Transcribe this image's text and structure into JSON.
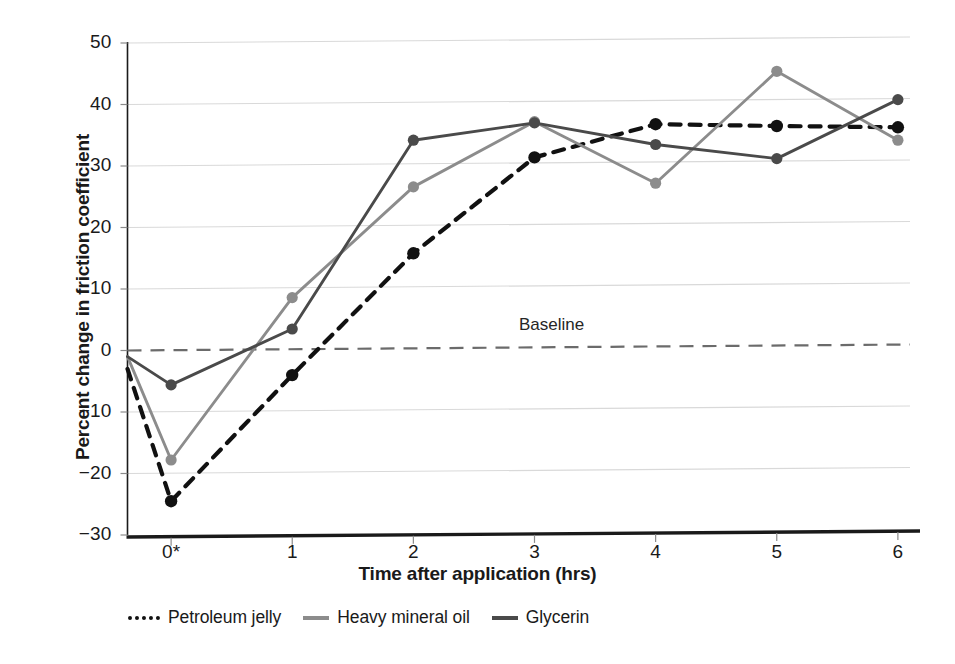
{
  "chart_data": {
    "type": "line",
    "title": "",
    "subtitle": "",
    "xlabel": "Time after application (hrs)",
    "ylabel": "Percent change in friction coefficient",
    "x": [
      0,
      1,
      2,
      3,
      4,
      5,
      6
    ],
    "xticklabels": [
      "0*",
      "1",
      "2",
      "3",
      "4",
      "5",
      "6"
    ],
    "xlim": [
      -0.36,
      6.1
    ],
    "ylim": [
      -30,
      50
    ],
    "yticks": [
      50,
      40,
      30,
      20,
      10,
      0,
      -10,
      -20,
      -30
    ],
    "yticklabels": [
      "50",
      "40",
      "30",
      "20",
      "10",
      "0",
      "−10",
      "−20",
      "−30"
    ],
    "grid": "horizontal",
    "legend_position": "below-axes-left",
    "annotations": [
      {
        "text": "Baseline",
        "x": 2.6,
        "y": 5.0
      }
    ],
    "reference_lines": [
      {
        "name": "baseline",
        "y": 0,
        "style": "dashed",
        "color": "#6b6b6b",
        "label": "Baseline"
      }
    ],
    "series": [
      {
        "name": "Petroleum jelly",
        "color": "#111111",
        "style": "dashed",
        "marker": "circle",
        "lead_in_y": -3.0,
        "values": [
          -24.5,
          -4.0,
          15.8,
          31.4,
          36.8,
          36.5,
          36.3
        ]
      },
      {
        "name": "Heavy mineral oil",
        "color": "#8c8c8c",
        "style": "solid",
        "marker": "circle",
        "lead_in_y": -1.0,
        "values": [
          -17.8,
          8.6,
          26.6,
          37.2,
          27.2,
          45.4,
          34.2
        ]
      },
      {
        "name": "Glycerin",
        "color": "#4a4a4a",
        "style": "solid",
        "marker": "circle",
        "lead_in_y": -1.0,
        "values": [
          -5.6,
          3.5,
          34.2,
          37.0,
          33.5,
          31.2,
          40.8
        ]
      }
    ]
  },
  "axes": {
    "y_axis_name": "Percent change in friction coefficient",
    "x_axis_name": "Time after application (hrs)"
  },
  "legend": {
    "items": [
      {
        "label": "Petroleum jelly",
        "style": "dashed",
        "color": "#111111"
      },
      {
        "label": "Heavy mineral oil",
        "style": "solid",
        "color": "#8c8c8c"
      },
      {
        "label": "Glycerin",
        "style": "solid",
        "color": "#4a4a4a"
      }
    ]
  },
  "colors": {
    "gridline": "#d9d9d9",
    "axis": "#1a1a1a",
    "baseline": "#6b6b6b",
    "petroleum_jelly": "#111111",
    "heavy_mineral_oil": "#8c8c8c",
    "glycerin": "#4a4a4a"
  }
}
